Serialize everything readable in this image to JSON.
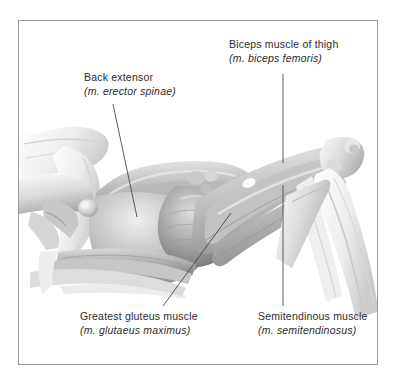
{
  "figure": {
    "title_hidden": "",
    "frame": {
      "border_color": "#9a9a9a",
      "background_color": "#ffffff"
    },
    "ink": {
      "text_color": "#2b2b2b",
      "leader_line_color": "#4a4a4a",
      "illustration_tone_dark": "#6e6e6e",
      "illustration_tone_mid": "#b4b4b4",
      "illustration_tone_light": "#e6e6e6"
    }
  },
  "labels": [
    {
      "id": "biceps-femoris",
      "common": "Biceps muscle of thigh",
      "latin": "(m. biceps femoris)",
      "leader": {
        "type": "vertical",
        "x1": 283,
        "y1": 74,
        "x2": 283,
        "y2": 163
      }
    },
    {
      "id": "erector-spinae",
      "common": "Back extensor",
      "latin": "(m. erector spinae)",
      "leader": {
        "type": "diagonal",
        "x1": 113,
        "y1": 104,
        "x2": 137,
        "y2": 217
      }
    },
    {
      "id": "glutaeus-maximus",
      "common": "Greatest gluteus muscle",
      "latin": "(m. glutaeus maximus)",
      "leader": {
        "type": "diagonal",
        "x1": 231,
        "y1": 213,
        "x2": 163,
        "y2": 306
      }
    },
    {
      "id": "semitendinosus",
      "common": "Semitendinous muscle",
      "latin": "(m. semitendinosus)",
      "leader": {
        "type": "vertical",
        "x1": 283,
        "y1": 185,
        "x2": 283,
        "y2": 306
      }
    }
  ]
}
